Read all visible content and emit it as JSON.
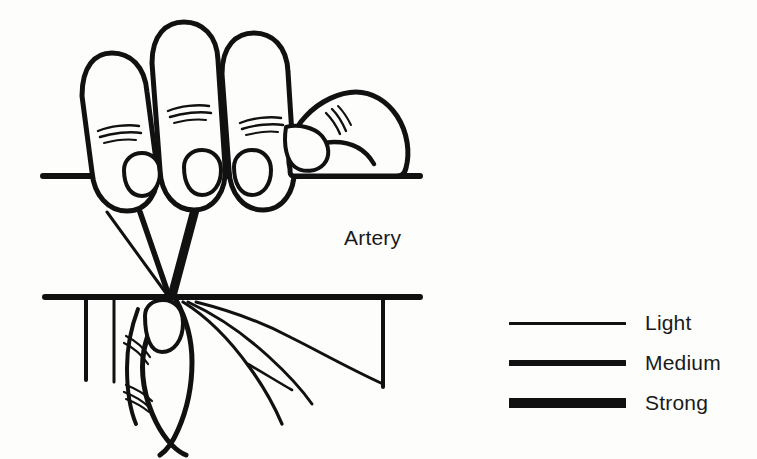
{
  "figure": {
    "background_color": "#fdfdfc",
    "ink_color": "#111111",
    "width": 757,
    "height": 459
  },
  "annotations": {
    "artery_label": "Artery"
  },
  "legend": {
    "items": [
      {
        "label": "Light",
        "thickness_px": 3,
        "icon": "line-thin-icon"
      },
      {
        "label": "Medium",
        "thickness_px": 6,
        "icon": "line-medium-icon"
      },
      {
        "label": "Strong",
        "thickness_px": 10,
        "icon": "line-thick-icon"
      }
    ]
  },
  "diagram": {
    "parts": [
      {
        "name": "index-finger",
        "icon": "finger-icon"
      },
      {
        "name": "middle-finger",
        "icon": "finger-icon"
      },
      {
        "name": "ring-finger",
        "icon": "finger-icon"
      },
      {
        "name": "little-finger",
        "icon": "finger-icon"
      },
      {
        "name": "thumb",
        "icon": "thumb-icon"
      },
      {
        "name": "artery-upper-wall",
        "icon": "artery-wall-icon"
      },
      {
        "name": "artery-lower-wall",
        "icon": "artery-wall-icon"
      },
      {
        "name": "pressure-ray-light",
        "icon": "line-thin-icon"
      },
      {
        "name": "pressure-ray-medium",
        "icon": "line-medium-icon"
      },
      {
        "name": "pressure-ray-strong",
        "icon": "line-thick-icon"
      },
      {
        "name": "palm-crease-lines",
        "icon": "crease-icon"
      }
    ]
  }
}
